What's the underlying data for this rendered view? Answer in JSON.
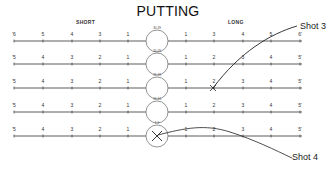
{
  "title": "PUTTING",
  "headers": {
    "short": "SHORT",
    "long": "LONG"
  },
  "rows": [
    {
      "circle_label": "30-39",
      "left_ticks": [
        "'6",
        "5",
        "4",
        "3",
        "1"
      ],
      "right_ticks": [
        "1",
        "3",
        "4",
        "5",
        "6'"
      ]
    },
    {
      "circle_label": "20-29",
      "left_ticks": [
        "'5",
        "4",
        "3",
        "2",
        "1"
      ],
      "right_ticks": [
        "1",
        "2",
        "3",
        "4",
        "5'"
      ]
    },
    {
      "circle_label": "15-19",
      "left_ticks": [
        "'5",
        "4",
        "3",
        "2",
        "1"
      ],
      "right_ticks": [
        "1",
        "2",
        "3",
        "4",
        "5'"
      ]
    },
    {
      "circle_label": "10-14",
      "left_ticks": [
        "'5",
        "4",
        "3",
        "2",
        "1"
      ],
      "right_ticks": [
        "1",
        "2",
        "3",
        "4",
        "5'"
      ]
    },
    {
      "circle_label": "1-9",
      "left_ticks": [
        "'5",
        "4",
        "3",
        "2",
        "1"
      ],
      "right_ticks": [
        "1",
        "2",
        "3",
        "4",
        "5'"
      ]
    }
  ],
  "shots": [
    {
      "label": "Shot 3",
      "ends_at_row": 3,
      "mark": "X"
    },
    {
      "label": "Shot 4",
      "starts_at_row": 5,
      "mark": "X"
    }
  ],
  "colors": {
    "line": "#333333",
    "circle": "#666666",
    "text": "#222222"
  }
}
